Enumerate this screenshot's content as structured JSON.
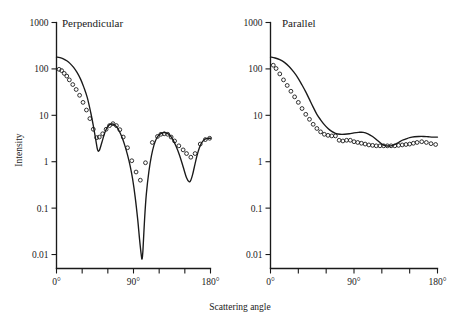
{
  "figure": {
    "xlabel": "Scattering angle",
    "ylabel": "Intensity"
  },
  "chart_data": [
    {
      "type": "line",
      "title": "Perpendicular",
      "xlabel": "Scattering angle",
      "ylabel": "Intensity",
      "yscale": "log",
      "ylim": [
        0.005,
        1000
      ],
      "xlim": [
        0,
        180
      ],
      "ytick_labels": [
        "1000",
        "100",
        "10",
        "1",
        "0.1",
        "0.01"
      ],
      "ytick_values": [
        1000,
        100,
        10,
        1,
        0.1,
        0.01
      ],
      "xtick_values": [
        0,
        30,
        60,
        90,
        120,
        150,
        180
      ],
      "xtick_labels": [
        "0°",
        "",
        "",
        "90°",
        "",
        "",
        "180°"
      ],
      "grid": false,
      "legend": "none",
      "series": [
        {
          "name": "theory-curve",
          "style": "solid-line",
          "x": [
            0,
            4,
            8,
            12,
            16,
            20,
            24,
            28,
            32,
            36,
            40,
            43,
            46,
            48,
            50,
            53,
            56,
            59,
            62,
            65,
            68,
            71,
            74,
            77,
            80,
            83,
            86,
            89,
            92,
            95,
            97,
            99,
            100,
            101,
            103,
            105,
            108,
            111,
            114,
            117,
            120,
            124,
            128,
            132,
            136,
            140,
            144,
            148,
            152,
            155,
            157,
            159,
            161,
            164,
            167,
            170,
            174,
            178,
            180
          ],
          "y": [
            180,
            175,
            165,
            150,
            130,
            108,
            84,
            61,
            40,
            24,
            11.5,
            6.0,
            2.9,
            1.8,
            1.75,
            2.6,
            4.0,
            5.4,
            6.3,
            6.5,
            6.2,
            5.4,
            4.3,
            3.2,
            2.2,
            1.4,
            0.82,
            0.42,
            0.17,
            0.055,
            0.022,
            0.01,
            0.008,
            0.012,
            0.06,
            0.2,
            0.62,
            1.35,
            2.3,
            3.2,
            3.8,
            4.2,
            4.2,
            3.8,
            3.0,
            2.1,
            1.35,
            0.78,
            0.45,
            0.37,
            0.4,
            0.52,
            0.75,
            1.3,
            2.0,
            2.6,
            3.1,
            3.2,
            3.2
          ]
        },
        {
          "name": "measured-points",
          "style": "open-circles",
          "x": [
            3,
            6,
            9,
            12,
            15,
            19,
            23,
            27,
            31,
            35,
            39,
            43,
            47,
            50,
            54,
            58,
            62,
            66,
            70,
            74,
            78,
            83,
            88,
            93,
            98,
            104,
            112,
            118,
            122,
            126,
            130,
            134,
            138,
            143,
            148,
            152,
            157,
            162,
            168,
            174,
            179
          ],
          "y": [
            98,
            92,
            80,
            70,
            58,
            46,
            36,
            27,
            19,
            13,
            8.5,
            5.0,
            3.3,
            3.4,
            4.0,
            5.0,
            6.0,
            6.6,
            6.0,
            4.9,
            3.4,
            2.0,
            1.05,
            0.6,
            0.4,
            0.95,
            2.6,
            3.5,
            3.9,
            4.0,
            3.9,
            3.4,
            2.8,
            2.2,
            1.8,
            1.5,
            1.25,
            1.5,
            2.4,
            3.0,
            3.2
          ]
        }
      ]
    },
    {
      "type": "line",
      "title": "Parallel",
      "xlabel": "Scattering angle",
      "ylabel": "Intensity",
      "yscale": "log",
      "ylim": [
        0.005,
        1000
      ],
      "xlim": [
        0,
        180
      ],
      "ytick_labels": [
        "1000",
        "100",
        "10",
        "1",
        "0.1",
        "0.01"
      ],
      "ytick_values": [
        1000,
        100,
        10,
        1,
        0.1,
        0.01
      ],
      "xtick_values": [
        0,
        30,
        60,
        90,
        120,
        150,
        180
      ],
      "xtick_labels": [
        "0°",
        "",
        "",
        "90°",
        "",
        "",
        "180°"
      ],
      "grid": false,
      "legend": "none",
      "series": [
        {
          "name": "theory-curve",
          "style": "solid-line",
          "x": [
            0,
            5,
            10,
            15,
            20,
            25,
            30,
            34,
            38,
            42,
            46,
            50,
            54,
            58,
            62,
            66,
            70,
            75,
            80,
            85,
            90,
            95,
            100,
            105,
            110,
            115,
            120,
            125,
            130,
            134,
            138,
            142,
            146,
            150,
            155,
            160,
            165,
            170,
            175,
            180
          ],
          "y": [
            180,
            172,
            158,
            138,
            113,
            86,
            62,
            45,
            32,
            22,
            15,
            10.5,
            8.0,
            6.3,
            5.2,
            4.5,
            4.1,
            3.9,
            3.9,
            4.0,
            4.2,
            4.3,
            4.3,
            4.0,
            3.5,
            2.9,
            2.4,
            2.2,
            2.2,
            2.35,
            2.6,
            2.9,
            3.1,
            3.3,
            3.45,
            3.5,
            3.5,
            3.45,
            3.4,
            3.4
          ]
        },
        {
          "name": "measured-points",
          "style": "open-circles",
          "x": [
            3,
            6,
            10,
            14,
            18,
            22,
            26,
            30,
            34,
            38,
            42,
            46,
            50,
            54,
            58,
            62,
            66,
            70,
            74,
            78,
            82,
            86,
            90,
            94,
            98,
            102,
            106,
            110,
            114,
            118,
            122,
            126,
            130,
            134,
            138,
            142,
            146,
            150,
            154,
            158,
            163,
            168,
            173,
            178
          ],
          "y": [
            120,
            102,
            78,
            58,
            44,
            33,
            25,
            19,
            14,
            10.5,
            8.2,
            6.4,
            5.2,
            4.4,
            3.9,
            3.7,
            3.6,
            3.6,
            2.9,
            2.8,
            2.9,
            2.9,
            2.7,
            2.6,
            2.5,
            2.4,
            2.3,
            2.25,
            2.2,
            2.2,
            2.2,
            2.2,
            2.2,
            2.2,
            2.25,
            2.3,
            2.35,
            2.4,
            2.5,
            2.6,
            2.7,
            2.6,
            2.45,
            2.35
          ]
        }
      ]
    }
  ]
}
